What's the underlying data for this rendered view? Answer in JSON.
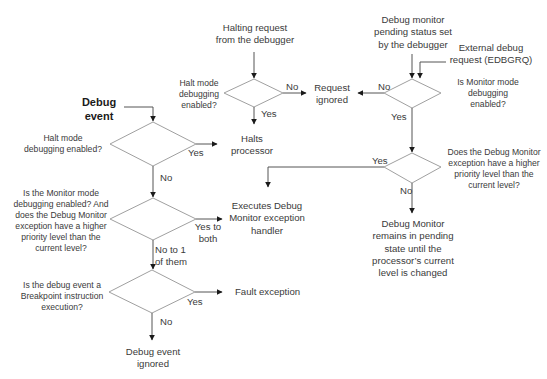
{
  "diagram": {
    "start": {
      "line1": "Debug",
      "line2": "event"
    },
    "decisions": {
      "halt_left": [
        "Halt mode",
        "debugging enabled?"
      ],
      "monitor_priority_left": [
        "Is the Monitor mode",
        "debugging enabled? And",
        "does the Debug Monitor",
        "exception have a higher",
        "priority level than the",
        "current level?"
      ],
      "breakpoint": [
        "Is the debug event a",
        "Breakpoint instruction",
        "execution?"
      ],
      "halt_top": [
        "Halt mode",
        "debugging",
        "enabled?"
      ],
      "monitor_enabled": [
        "Is Monitor mode",
        "debugging",
        "enabled?"
      ],
      "priority_right": [
        "Does the Debug Monitor",
        "exception have a higher",
        "priority level than the",
        "current level?"
      ]
    },
    "inputs": {
      "halting_request": [
        "Halting request",
        "from the debugger"
      ],
      "monitor_pending": [
        "Debug monitor",
        "pending status set",
        "by the debugger"
      ],
      "external_request": [
        "External debug",
        "request (EDBGRQ)"
      ]
    },
    "outcomes": {
      "request_ignored": [
        "Request",
        "ignored"
      ],
      "halts_processor": [
        "Halts",
        "processor"
      ],
      "executes_handler": [
        "Executes Debug",
        "Monitor exception",
        "handler"
      ],
      "pending_state": [
        "Debug Monitor",
        "remains in pending",
        "state until the",
        "processor’s current",
        "level is changed"
      ],
      "fault_exception": "Fault exception",
      "debug_event_ignored": [
        "Debug event",
        "ignored"
      ]
    },
    "edge_labels": {
      "yes": "Yes",
      "no": "No",
      "yes_to_both": [
        "Yes to",
        "both"
      ],
      "no_to_one": [
        "No to 1",
        "of them"
      ]
    },
    "colors": {
      "line": "#333333",
      "diamond": "#9a9a9a",
      "text": "#3a3a3a"
    }
  }
}
